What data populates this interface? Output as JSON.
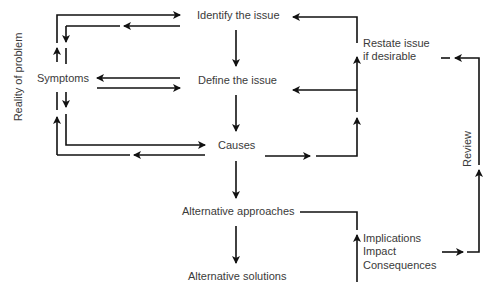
{
  "diagram": {
    "type": "process-flow",
    "nodes": {
      "identify": "Identify the issue",
      "define": "Define the issue",
      "causes": "Causes",
      "approaches": "Alternative approaches",
      "solutions": "Alternative solutions",
      "symptoms": "Symptoms",
      "restate_line1": "Restate issue",
      "restate_line2": "if desirable",
      "implications": "Implications",
      "impact": "Impact",
      "consequences": "Consequences"
    },
    "side_labels": {
      "left": "Reality of problem",
      "right": "Review"
    },
    "edges": [
      {
        "from": "Identify the issue",
        "to": "Define the issue"
      },
      {
        "from": "Define the issue",
        "to": "Causes"
      },
      {
        "from": "Causes",
        "to": "Alternative approaches"
      },
      {
        "from": "Alternative approaches",
        "to": "Alternative solutions"
      },
      {
        "from": "Symptoms",
        "to": "Identify the issue"
      },
      {
        "from": "Identify the issue",
        "to": "Symptoms"
      },
      {
        "from": "Symptoms",
        "to": "Define the issue"
      },
      {
        "from": "Define the issue",
        "to": "Symptoms"
      },
      {
        "from": "Symptoms",
        "to": "Causes"
      },
      {
        "from": "Causes",
        "to": "Symptoms"
      },
      {
        "from": "Causes",
        "to": "Restate issue if desirable"
      },
      {
        "from": "Restate issue if desirable",
        "to": "Identify the issue"
      },
      {
        "from": "Restate issue if desirable",
        "to": "Define the issue"
      },
      {
        "from": "Alternative approaches",
        "to": "Implications Impact Consequences"
      },
      {
        "from": "Implications Impact Consequences",
        "to": "Review"
      },
      {
        "from": "Review",
        "to": "Restate issue if desirable"
      }
    ],
    "colors": {
      "line": "#111111",
      "text": "#3a3a3a",
      "background": "#ffffff"
    }
  }
}
